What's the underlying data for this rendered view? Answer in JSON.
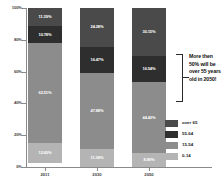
{
  "chart_data": {
    "type": "bar",
    "subtype": "stacked-100-percent",
    "title": "",
    "xlabel": "",
    "ylabel": "",
    "ylim": [
      0,
      100
    ],
    "ytick_labels": [
      "0%",
      "20%",
      "40%",
      "60%",
      "80%",
      "100%"
    ],
    "ytick_values": [
      0,
      20,
      40,
      60,
      80,
      100
    ],
    "grid": false,
    "legend_position": "right-bottom",
    "categories": [
      "2011",
      "2030",
      "2050"
    ],
    "series": [
      {
        "name": "over 65",
        "color": "#4a4a4a",
        "values": [
          11.39,
          24.28,
          30.15
        ],
        "labels": [
          "11.39%",
          "24.28%",
          "30.15%"
        ]
      },
      {
        "name": "55-64",
        "color": "#2e2e2e",
        "values": [
          10.78,
          16.47,
          16.54
        ],
        "labels": [
          "10.78%",
          "16.47%",
          "16.54%"
        ]
      },
      {
        "name": "15-54",
        "color": "#8c8c8c",
        "values": [
          62.51,
          47.88,
          44.42
        ],
        "labels": [
          "62.51%",
          "47.88%",
          "44.42%"
        ]
      },
      {
        "name": "0-14",
        "color": "#b4b4b4",
        "values": [
          12.6,
          11.38,
          8.89
        ],
        "labels": [
          "12.60%",
          "11.38%",
          "8.89%"
        ]
      }
    ],
    "annotations": [
      {
        "text": "More then 50% will be over 55 years old in 2050!",
        "target_category": "2050",
        "target_series": [
          "over 65",
          "55-64"
        ],
        "marker": "bracket"
      }
    ]
  },
  "legend": {
    "items": [
      {
        "label": "over 65",
        "color": "#4a4a4a"
      },
      {
        "label": "55-64",
        "color": "#2e2e2e"
      },
      {
        "label": "15-54",
        "color": "#8c8c8c"
      },
      {
        "label": "0-14",
        "color": "#b4b4b4"
      }
    ]
  },
  "axes": {
    "y_labels": [
      "100%",
      "80%",
      "60%",
      "40%",
      "20%",
      "0%"
    ],
    "x_labels": [
      "2011",
      "2030",
      "2050"
    ]
  },
  "annotation": {
    "text": "More then 50% will be over 55 years old in 2050!"
  }
}
